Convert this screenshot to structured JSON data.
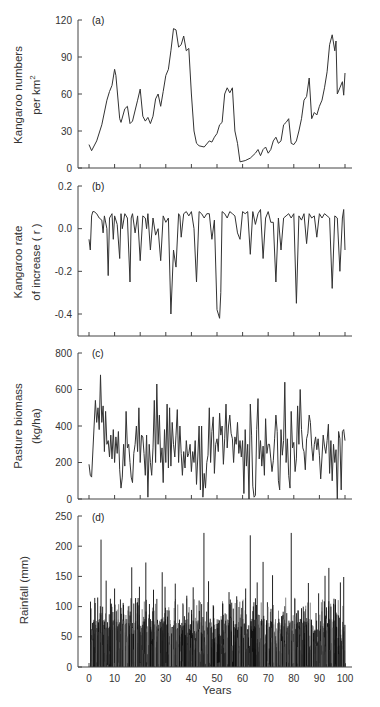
{
  "chart_data": [
    {
      "panel": "a",
      "type": "line",
      "panel_label": "(a)",
      "ylabel_line1": "Kangaroo numbers",
      "ylabel_line2": "per km",
      "ylabel_superscript": "2",
      "xlabel": "",
      "ylim": [
        0,
        120
      ],
      "yticks": [
        0,
        30,
        60,
        90,
        120
      ],
      "ytick_labels": [
        "0",
        "30",
        "60",
        "90",
        "120"
      ],
      "xlim": [
        0,
        100
      ],
      "x": [
        0,
        1,
        3,
        5,
        7,
        8,
        9,
        10,
        10.5,
        12,
        12.5,
        14,
        15,
        16,
        17,
        19,
        20,
        21,
        22,
        23,
        24,
        25,
        26,
        27,
        28,
        29,
        30,
        31,
        32,
        33,
        34,
        35,
        36,
        37,
        38,
        39,
        40,
        41,
        42,
        43,
        45,
        47,
        48,
        49,
        50,
        51,
        52,
        53,
        54,
        55,
        56,
        57,
        58,
        59,
        61,
        63,
        65,
        66,
        67,
        68,
        69,
        70,
        71,
        72,
        73,
        74,
        75,
        76,
        77,
        78,
        79,
        80,
        81,
        82,
        83,
        84,
        85,
        86,
        87,
        88,
        89,
        90,
        91,
        92,
        93,
        94,
        95,
        96,
        96.5,
        97,
        98,
        99,
        99.5,
        100
      ],
      "values": [
        19,
        14,
        22,
        35,
        55,
        62,
        67,
        80,
        75,
        40,
        37,
        48,
        50,
        36,
        38,
        55,
        64,
        42,
        38,
        41,
        36,
        42,
        56,
        60,
        50,
        62,
        75,
        80,
        95,
        113,
        112,
        98,
        100,
        107,
        95,
        97,
        60,
        30,
        20,
        18,
        17,
        22,
        21,
        25,
        28,
        35,
        37,
        60,
        65,
        61,
        65,
        30,
        20,
        5,
        6,
        8,
        12,
        15,
        10,
        15,
        17,
        12,
        15,
        22,
        25,
        20,
        22,
        35,
        37,
        40,
        20,
        19,
        22,
        30,
        40,
        55,
        58,
        73,
        40,
        45,
        43,
        50,
        55,
        65,
        78,
        100,
        108,
        95,
        103,
        60,
        65,
        70,
        59,
        77
      ]
    },
    {
      "panel": "b",
      "type": "line",
      "panel_label": "(b)",
      "ylabel_line1": "Kangaroo rate",
      "ylabel_line2": "of increase ( r )",
      "xlabel": "",
      "ylim": [
        -0.5,
        0.2
      ],
      "yticks": [
        0.2,
        0.0,
        -0.2,
        -0.4
      ],
      "ytick_labels": [
        "0.2",
        "0.0",
        "-0.2",
        "-0.4"
      ],
      "xlim": [
        0,
        100
      ],
      "x": [
        0,
        0.5,
        1,
        1.5,
        2,
        3,
        4,
        5,
        5.5,
        6,
        7,
        7.5,
        8,
        9,
        9.5,
        10,
        11,
        12,
        12.5,
        13,
        14,
        15,
        16,
        16.5,
        17,
        18,
        19,
        20,
        21,
        22,
        22.5,
        23,
        24,
        25,
        26,
        27,
        28,
        29,
        30,
        31,
        32,
        33,
        34,
        35,
        35.5,
        36,
        37,
        38,
        39,
        40,
        41,
        42,
        43,
        44,
        45,
        46,
        47,
        48,
        49,
        50,
        50.5,
        51,
        51.5,
        52,
        53,
        54,
        55,
        56,
        57,
        58,
        59,
        60,
        61,
        62,
        63,
        64,
        65,
        66,
        67,
        68,
        69,
        70,
        71,
        72,
        73,
        74,
        75,
        76,
        77,
        78,
        79,
        80,
        81,
        82,
        83,
        84,
        85,
        86,
        87,
        88,
        89,
        90,
        91,
        92,
        93,
        94,
        95,
        96,
        97,
        98,
        99,
        99.5,
        100
      ],
      "values": [
        -0.05,
        -0.1,
        0.06,
        0.08,
        0.08,
        0.07,
        0.05,
        0.04,
        -0.02,
        0.06,
        0.0,
        -0.22,
        0.05,
        0.07,
        -0.05,
        0.06,
        0.02,
        -0.14,
        0.07,
        0.0,
        0.07,
        0.05,
        -0.25,
        0.05,
        0.07,
        -0.02,
        0.06,
        -0.15,
        0.06,
        0.05,
        0.0,
        0.07,
        -0.1,
        0.05,
        -0.03,
        0.0,
        -0.15,
        0.06,
        0.03,
        0.05,
        -0.4,
        -0.1,
        -0.18,
        0.07,
        0.06,
        -0.04,
        0.07,
        0.08,
        0.06,
        0.08,
        0.0,
        -0.25,
        0.08,
        0.07,
        0.05,
        0.07,
        0.07,
        -0.05,
        0.04,
        -0.38,
        -0.4,
        -0.42,
        -0.3,
        0.08,
        0.07,
        0.05,
        0.08,
        0.07,
        0.06,
        -0.02,
        -0.05,
        0.08,
        0.07,
        0.08,
        -0.12,
        0.08,
        0.02,
        0.07,
        0.09,
        -0.14,
        0.05,
        0.08,
        0.03,
        0.03,
        -0.25,
        0.05,
        -0.1,
        0.05,
        0.06,
        0.07,
        0.05,
        0.07,
        -0.35,
        0.06,
        0.04,
        0.07,
        -0.07,
        0.07,
        0.05,
        0.06,
        -0.04,
        0.07,
        0.05,
        0.07,
        0.06,
        0.05,
        -0.28,
        0.06,
        0.05,
        -0.2,
        0.05,
        0.09,
        -0.1
      ]
    },
    {
      "panel": "c",
      "type": "line",
      "panel_label": "(c)",
      "ylabel_line1": "Pasture biomass",
      "ylabel_line2": "(kg/ha)",
      "xlabel": "",
      "ylim": [
        0,
        800
      ],
      "yticks": [
        0,
        200,
        400,
        600,
        800
      ],
      "ytick_labels": [
        "0",
        "200",
        "400",
        "600",
        "800"
      ],
      "xlim": [
        0,
        100
      ],
      "x": [
        0,
        0.5,
        1,
        2,
        2.5,
        3,
        3.5,
        4,
        4.5,
        5,
        5.5,
        6,
        6.5,
        7,
        7.5,
        8,
        8.5,
        9,
        9.5,
        10,
        10.5,
        11,
        11.5,
        12,
        12.5,
        13,
        13.5,
        14,
        14.5,
        15,
        15.5,
        16,
        16.5,
        17,
        17.5,
        18,
        18.5,
        19,
        19.5,
        20,
        20.5,
        21,
        21.5,
        22,
        22.5,
        23,
        23.5,
        24,
        24.5,
        25,
        25.5,
        26,
        26.5,
        27,
        27.5,
        28,
        28.5,
        29,
        29.5,
        30,
        30.5,
        31,
        31.5,
        32,
        32.5,
        33,
        33.5,
        34,
        34.5,
        35,
        35.5,
        36,
        36.5,
        37,
        37.5,
        38,
        38.5,
        39,
        39.5,
        40,
        40.5,
        41,
        41.5,
        42,
        42.5,
        43,
        43.5,
        44,
        44.5,
        45,
        45.5,
        46,
        46.5,
        47,
        47.5,
        48,
        48.5,
        49,
        49.5,
        50,
        50.5,
        51,
        51.5,
        52,
        52.5,
        53,
        53.5,
        54,
        54.5,
        55,
        55.5,
        56,
        56.5,
        57,
        57.5,
        58,
        58.5,
        59,
        59.5,
        60,
        60.5,
        61,
        61.5,
        62,
        62.5,
        63,
        63.5,
        64,
        64.5,
        65,
        65.5,
        66,
        66.5,
        67,
        67.5,
        68,
        68.5,
        69,
        69.5,
        70,
        70.5,
        71,
        71.5,
        72,
        72.5,
        73,
        73.5,
        74,
        74.5,
        75,
        75.5,
        76,
        76.5,
        77,
        77.5,
        78,
        78.5,
        79,
        79.5,
        80,
        80.5,
        81,
        81.5,
        82,
        82.5,
        83,
        83.5,
        84,
        84.5,
        85,
        85.5,
        86,
        86.5,
        87,
        87.5,
        88,
        88.5,
        89,
        89.5,
        90,
        90.5,
        91,
        91.5,
        92,
        92.5,
        93,
        93.5,
        94,
        94.5,
        95,
        95.5,
        96,
        96.5,
        97,
        97.5,
        98,
        98.5,
        99,
        99.5,
        100
      ],
      "values": [
        190,
        130,
        120,
        400,
        540,
        420,
        500,
        380,
        680,
        420,
        510,
        260,
        480,
        300,
        320,
        230,
        350,
        220,
        380,
        200,
        340,
        250,
        370,
        160,
        60,
        120,
        300,
        180,
        480,
        280,
        300,
        200,
        120,
        90,
        250,
        300,
        400,
        260,
        500,
        200,
        350,
        340,
        250,
        130,
        350,
        10,
        300,
        200,
        130,
        280,
        540,
        200,
        630,
        300,
        460,
        200,
        280,
        90,
        380,
        200,
        520,
        170,
        500,
        180,
        420,
        300,
        230,
        350,
        490,
        200,
        400,
        250,
        130,
        260,
        170,
        320,
        230,
        250,
        300,
        150,
        260,
        200,
        320,
        80,
        230,
        400,
        50,
        400,
        10,
        140,
        60,
        200,
        240,
        500,
        200,
        370,
        450,
        140,
        300,
        330,
        260,
        470,
        350,
        400,
        190,
        330,
        520,
        280,
        400,
        460,
        360,
        330,
        200,
        340,
        300,
        420,
        250,
        320,
        230,
        320,
        30,
        380,
        180,
        300,
        0,
        520,
        350,
        70,
        10,
        20,
        380,
        550,
        220,
        320,
        180,
        290,
        130,
        440,
        250,
        300,
        300,
        220,
        150,
        210,
        330,
        460,
        370,
        100,
        50,
        380,
        240,
        320,
        640,
        200,
        330,
        130,
        60,
        480,
        280,
        310,
        150,
        220,
        510,
        300,
        600,
        380,
        280,
        260,
        160,
        330,
        360,
        460,
        420,
        290,
        210,
        300,
        340,
        270,
        330,
        240,
        110,
        230,
        350,
        290,
        250,
        320,
        410,
        140,
        320,
        100,
        300,
        200,
        270,
        0,
        370,
        330,
        50,
        370,
        380,
        320,
        500,
        330,
        100,
        330,
        380,
        50,
        300,
        200,
        620
      ]
    },
    {
      "panel": "d",
      "type": "bar",
      "panel_label": "(d)",
      "ylabel_line1": "Rainfall (mm)",
      "xlabel": "Years",
      "ylim": [
        0,
        250
      ],
      "yticks": [
        0,
        50,
        100,
        150,
        200,
        250
      ],
      "ytick_labels": [
        "0",
        "50",
        "100",
        "150",
        "200",
        "250"
      ],
      "xlim": [
        0,
        105
      ],
      "xticks": [
        0,
        10,
        20,
        30,
        40,
        50,
        60,
        70,
        80,
        90,
        100
      ],
      "xtick_labels": [
        "0",
        "10",
        "20",
        "30",
        "40",
        "50",
        "60",
        "70",
        "80",
        "90",
        "100"
      ],
      "note": "monthly rainfall bars, years 0-100; values are representative peaks read from figure",
      "peaks": [
        {
          "x": 0.5,
          "y": 42
        },
        {
          "x": 2.2,
          "y": 106
        },
        {
          "x": 3.2,
          "y": 115
        },
        {
          "x": 4.5,
          "y": 211
        },
        {
          "x": 6.5,
          "y": 143
        },
        {
          "x": 8.5,
          "y": 105
        },
        {
          "x": 9.8,
          "y": 130
        },
        {
          "x": 12.3,
          "y": 98
        },
        {
          "x": 16.5,
          "y": 165
        },
        {
          "x": 18,
          "y": 114
        },
        {
          "x": 19.5,
          "y": 133
        },
        {
          "x": 22,
          "y": 173
        },
        {
          "x": 25,
          "y": 128
        },
        {
          "x": 28.4,
          "y": 157
        },
        {
          "x": 29.5,
          "y": 133
        },
        {
          "x": 33.5,
          "y": 138
        },
        {
          "x": 38,
          "y": 118
        },
        {
          "x": 40.5,
          "y": 132
        },
        {
          "x": 44.7,
          "y": 222
        },
        {
          "x": 46.5,
          "y": 142
        },
        {
          "x": 52,
          "y": 105
        },
        {
          "x": 54.5,
          "y": 124
        },
        {
          "x": 57.5,
          "y": 117
        },
        {
          "x": 61,
          "y": 130
        },
        {
          "x": 62.8,
          "y": 218
        },
        {
          "x": 65.5,
          "y": 140
        },
        {
          "x": 67.8,
          "y": 174
        },
        {
          "x": 71.5,
          "y": 152
        },
        {
          "x": 78.8,
          "y": 222
        },
        {
          "x": 83.5,
          "y": 100
        },
        {
          "x": 85.5,
          "y": 139
        },
        {
          "x": 89.5,
          "y": 122
        },
        {
          "x": 92,
          "y": 151
        },
        {
          "x": 93.5,
          "y": 164
        },
        {
          "x": 95.5,
          "y": 113
        },
        {
          "x": 98,
          "y": 140
        },
        {
          "x": 99.3,
          "y": 149
        }
      ]
    }
  ]
}
